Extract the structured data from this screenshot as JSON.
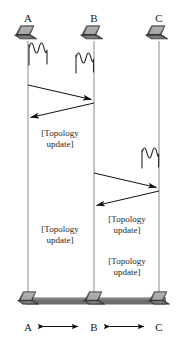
{
  "diagram": {
    "type": "sequence-diagram",
    "background_color": "#ffffff",
    "line_color": "#8a8a8a",
    "arrow_color": "#111111",
    "bus_color": "#6e6e6e",
    "nodes": [
      {
        "id": "A",
        "label": "A",
        "x": 28,
        "icon": "laptop-icon"
      },
      {
        "id": "B",
        "label": "B",
        "x": 94,
        "icon": "laptop-icon"
      },
      {
        "id": "C",
        "label": "C",
        "x": 159,
        "icon": "laptop-icon"
      }
    ],
    "bottom_nodes": [
      {
        "id": "A",
        "label": "A",
        "x": 28,
        "icon": "laptop-icon"
      },
      {
        "id": "B",
        "label": "B",
        "x": 94,
        "icon": "laptop-icon"
      },
      {
        "id": "C",
        "label": "C",
        "x": 159,
        "icon": "laptop-icon"
      }
    ],
    "signals": [
      {
        "id": "sig-a",
        "near": "A",
        "x": 34,
        "y": 46,
        "icon": "radio-wave-icon"
      },
      {
        "id": "sig-b",
        "near": "B",
        "x": 82,
        "y": 55,
        "icon": "radio-wave-icon"
      },
      {
        "id": "sig-c",
        "near": "C",
        "x": 150,
        "y": 150,
        "icon": "radio-wave-icon"
      }
    ],
    "messages": [
      {
        "id": "msg-a-to-b",
        "from": "A",
        "to": "B",
        "x1": 28,
        "y1": 85,
        "x2": 94,
        "y2": 100,
        "direction": "right"
      },
      {
        "id": "msg-b-to-a",
        "from": "B",
        "to": "A",
        "x1": 94,
        "y1": 103,
        "x2": 28,
        "y2": 118,
        "direction": "left"
      },
      {
        "id": "msg-b-to-c",
        "from": "B",
        "to": "C",
        "x1": 94,
        "y1": 173,
        "x2": 159,
        "y2": 188,
        "direction": "right"
      },
      {
        "id": "msg-c-to-b",
        "from": "C",
        "to": "B",
        "x1": 159,
        "y1": 191,
        "x2": 94,
        "y2": 206,
        "direction": "left"
      }
    ],
    "annotations": [
      {
        "id": "ann-1",
        "line1": "[Topology",
        "line2": "update]",
        "x": 60,
        "y": 136
      },
      {
        "id": "ann-2",
        "line1": "[Topology",
        "line2": "update]",
        "x": 137,
        "y": 222
      },
      {
        "id": "ann-3",
        "line1": "[Topology",
        "line2": "update]",
        "x": 60,
        "y": 232
      },
      {
        "id": "ann-4",
        "line1": "[Topology",
        "line2": "update]",
        "x": 137,
        "y": 264
      }
    ],
    "bottom_links": [
      {
        "id": "link-ab",
        "from": "A",
        "to": "B",
        "x1": 40,
        "y": 324,
        "x2": 82,
        "label": "bidirectional"
      },
      {
        "id": "link-bc",
        "from": "B",
        "to": "C",
        "x1": 106,
        "y": 324,
        "x2": 148,
        "label": "bidirectional"
      }
    ],
    "bus": {
      "x1": 26,
      "x2": 166,
      "y": 300,
      "thickness": 7
    }
  }
}
